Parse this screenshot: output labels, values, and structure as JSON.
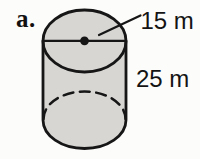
{
  "figure": {
    "part_label": "a.",
    "shape": "cylinder",
    "labels": {
      "diameter": "15 m",
      "height": "25 m"
    },
    "dimensions": {
      "diameter_m": 15,
      "height_m": 25,
      "unit": "m"
    }
  },
  "colors": {
    "cylinder_fill": "#d7d6d3",
    "line": "#161616",
    "background": "#fcfcfb"
  }
}
